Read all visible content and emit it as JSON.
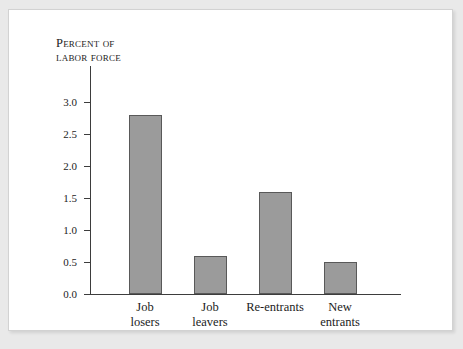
{
  "figure": {
    "background_color": "#ffffff",
    "page_background_color": "#e9e9e9",
    "frame_border_color": "#d2d2d2"
  },
  "chart_data": {
    "type": "bar",
    "title": "",
    "subtitle": "",
    "axis_title_lines": [
      "Percent of",
      "labor force"
    ],
    "ylabel": "Percent of labor force",
    "xlabel": "",
    "categories": [
      "Job losers",
      "Job leavers",
      "Re-entrants",
      "New entrants"
    ],
    "category_label_lines": [
      [
        "Job",
        "losers"
      ],
      [
        "Job",
        "leavers"
      ],
      [
        "Re-entrants"
      ],
      [
        "New",
        "entrants"
      ]
    ],
    "values": [
      2.8,
      0.6,
      1.6,
      0.5
    ],
    "ylim": [
      0.0,
      3.0
    ],
    "ytick_labels": [
      "0.0",
      "0.5",
      "1.0",
      "1.5",
      "2.0",
      "2.5",
      "3.0"
    ],
    "ytick_values": [
      0.0,
      0.5,
      1.0,
      1.5,
      2.0,
      2.5,
      3.0
    ],
    "grid": false,
    "legend": false,
    "legend_position": "none",
    "bar_fill_color": "#9b9b9b",
    "bar_edge_color": "#595959",
    "axis_color": "#3d3d3d"
  }
}
